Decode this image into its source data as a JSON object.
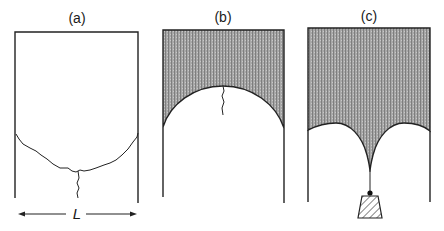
{
  "figure": {
    "panels": [
      {
        "id": "a",
        "label": "(a)",
        "description": "Empty box with cracked arch-shaped fracture line and vertical crack"
      },
      {
        "id": "b",
        "label": "(b)",
        "description": "Shaded material above a semicircular arch with a short crack at apex"
      },
      {
        "id": "c",
        "label": "(c)",
        "description": "Shaded material with two arches meeting at a cusp, hanging weight via string"
      }
    ],
    "dimension": {
      "label": "L",
      "applies_to": "a"
    },
    "colors": {
      "line": "#222222",
      "shade": "#9a9a9a",
      "background": "#ffffff"
    }
  }
}
